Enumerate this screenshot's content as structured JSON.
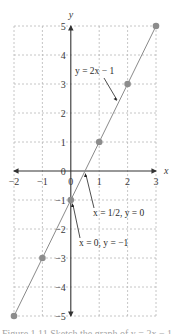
{
  "chart_data": {
    "type": "line",
    "title": "",
    "xlabel": "x",
    "ylabel": "y",
    "xlim": [
      -2,
      3
    ],
    "ylim": [
      -5,
      5
    ],
    "grid": true,
    "x_ticks": [
      -2,
      -1,
      0,
      1,
      2,
      3
    ],
    "y_ticks": [
      -5,
      -4,
      -3,
      -2,
      -1,
      0,
      1,
      2,
      3,
      4,
      5
    ],
    "series": [
      {
        "name": "y = 2x − 1",
        "line": [
          [
            -2,
            -5
          ],
          [
            3,
            5
          ]
        ],
        "points": [
          [
            -2,
            -5
          ],
          [
            -1,
            -3
          ],
          [
            0,
            -1
          ],
          [
            1,
            1
          ],
          [
            2,
            3
          ],
          [
            3,
            5
          ]
        ]
      }
    ],
    "annotations": [
      {
        "text": "y = 2x − 1",
        "arrow_to": [
          1.75,
          2.5
        ]
      },
      {
        "text": "x = 1/2, y = 0",
        "arrow_to": [
          0.5,
          0
        ]
      },
      {
        "text": "x = 0, y = −1",
        "arrow_to": [
          0.05,
          -1.1
        ]
      }
    ]
  },
  "labels": {
    "x_axis": "x",
    "y_axis": "y",
    "x_ticks": [
      "−2",
      "−1",
      "0",
      "1",
      "2",
      "3"
    ],
    "y_ticks": [
      "5",
      "4",
      "3",
      "2",
      "1",
      "0",
      "−1",
      "−2",
      "−3",
      "−4",
      "−5"
    ],
    "line_label": "y = 2x − 1",
    "intercept_x_label": "x = 1/2, y = 0",
    "intercept_y_label": "x = 0, y = −1"
  },
  "caption": "Figure 1.11  Sketch the graph of y = 2x − 1"
}
